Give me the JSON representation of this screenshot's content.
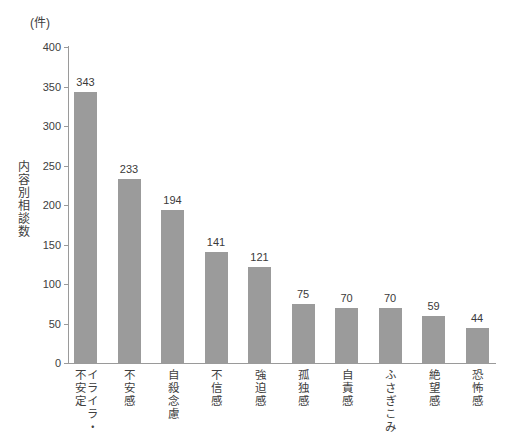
{
  "chart_data": {
    "type": "bar",
    "title": "",
    "unit_label": "(件)",
    "xlabel": "",
    "ylabel": "内容別相談数",
    "ylim": [
      0,
      400
    ],
    "ytick_step": 50,
    "yticks": [
      "400",
      "350",
      "300",
      "250",
      "200",
      "150",
      "100",
      "50",
      "0"
    ],
    "grid": false,
    "legend": "none",
    "bar_color": "#9b9b9b",
    "axis_color": "#9a9a9a",
    "text_color": "#3a3a3a",
    "categories": [
      "イライラ・不安定",
      "不安感",
      "自殺念慮",
      "不信感",
      "強迫感",
      "孤独感",
      "自責感",
      "ふさぎこみ",
      "絶望感",
      "恐怖感"
    ],
    "category_lines": [
      [
        "イライラ・",
        "不安定"
      ],
      [
        "不安感"
      ],
      [
        "自殺念慮"
      ],
      [
        "不信感"
      ],
      [
        "強迫感"
      ],
      [
        "孤独感"
      ],
      [
        "自責感"
      ],
      [
        "ふさぎこみ"
      ],
      [
        "絶望感"
      ],
      [
        "恐怖感"
      ]
    ],
    "values": [
      343,
      233,
      194,
      141,
      121,
      75,
      70,
      70,
      59,
      44
    ],
    "value_labels": [
      "343",
      "233",
      "194",
      "141",
      "121",
      "75",
      "70",
      "70",
      "59",
      "44"
    ]
  }
}
